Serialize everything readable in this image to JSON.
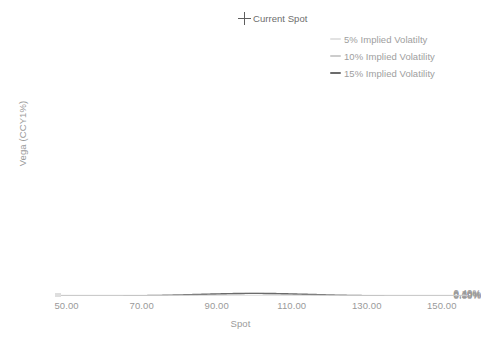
{
  "chart_data": {
    "type": "line",
    "title": "",
    "xlabel": "Spot",
    "ylabel": "Vega (CCY1%)",
    "xlim": [
      48.5,
      157.0
    ],
    "ylim": [
      0.0,
      0.4235
    ],
    "grid": false,
    "legend_position": "top-right",
    "x_ticks": [
      50,
      70,
      90,
      110,
      130,
      150
    ],
    "x_tick_labels": [
      "50.00",
      "70.00",
      "90.00",
      "110.00",
      "130.00",
      "150.00"
    ],
    "y_ticks": [
      0.0,
      0.001,
      0.002,
      0.003,
      0.004
    ],
    "y_tick_labels": [
      "0.00%",
      "0.10%",
      "0.20%",
      "0.30%",
      "0.40%"
    ],
    "annotations": [
      {
        "label": "Current Spot",
        "marker": "plus",
        "x": 100,
        "y": 0.00397,
        "color": "#5e5e5e"
      }
    ],
    "series": [
      {
        "name": "5% Implied Volatilty",
        "color": "#e9e9e9",
        "width": 1.2,
        "peak_x": 100,
        "peak_y": 0.00397,
        "sigma": 5.0,
        "x": [
          50,
          55,
          60,
          65,
          70,
          75,
          80,
          82,
          84,
          86,
          88,
          90,
          92,
          94,
          96,
          98,
          100,
          102,
          104,
          106,
          108,
          110,
          112,
          114,
          116,
          118,
          120,
          125,
          130,
          135,
          140,
          145,
          150,
          155
        ],
        "values": [
          0.0,
          0.0,
          0.0,
          0.0,
          0.0,
          0.0,
          1e-05,
          3e-05,
          8e-05,
          0.0002,
          0.00045,
          0.00092,
          0.00166,
          0.00258,
          0.00341,
          0.00391,
          0.00397,
          0.00369,
          0.00316,
          0.00244,
          0.00168,
          0.00103,
          0.00057,
          0.00028,
          0.00012,
          5e-05,
          2e-05,
          0.0,
          0.0,
          0.0,
          0.0,
          0.0,
          0.0,
          0.0
        ]
      },
      {
        "name": "10% Implied Volatility",
        "color": "#d4d4d4",
        "width": 1.2,
        "peak_x": 100,
        "peak_y": 0.00397,
        "sigma": 10.0,
        "x": [
          50,
          55,
          60,
          65,
          70,
          75,
          80,
          85,
          90,
          95,
          100,
          105,
          110,
          115,
          120,
          125,
          130,
          135,
          140,
          145,
          150,
          155
        ],
        "values": [
          0.0,
          0.0,
          1e-05,
          7e-05,
          0.00035,
          0.00108,
          0.00235,
          0.00357,
          0.00397,
          0.00372,
          0.00317,
          0.00244,
          0.00161,
          0.00092,
          0.00046,
          0.0002,
          8e-05,
          3e-05,
          1e-05,
          0.0,
          0.0,
          0.0
        ]
      },
      {
        "name": "15% Implied Volatility",
        "color": "#6b6b6b",
        "width": 1.4,
        "peak_x": 100,
        "peak_y": 0.00397,
        "sigma": 15.0,
        "x": [
          50,
          55,
          60,
          65,
          70,
          75,
          80,
          85,
          90,
          95,
          100,
          105,
          110,
          115,
          120,
          125,
          130,
          135,
          140,
          145,
          150,
          155
        ],
        "values": [
          3e-05,
          0.00014,
          0.00046,
          0.00118,
          0.00237,
          0.00356,
          0.00392,
          0.00386,
          0.00373,
          0.00381,
          0.00397,
          0.00379,
          0.00338,
          0.00276,
          0.00207,
          0.00143,
          0.00091,
          0.00053,
          0.00029,
          0.00014,
          7e-05,
          3e-05
        ]
      }
    ]
  },
  "axes": {
    "y_title": "Vega (CCY1%)",
    "x_title": "Spot"
  },
  "legend": {
    "items": [
      {
        "label": "5% Implied Volatilty",
        "color": "#e2e2e2"
      },
      {
        "label": "10% Implied Volatility",
        "color": "#cccccc"
      },
      {
        "label": "15% Implied Volatility",
        "color": "#6b6b6b"
      }
    ]
  },
  "annotation": {
    "current_spot_label": "Current Spot"
  },
  "colors": {
    "axis_line": "#dcdcdc",
    "tick_text": "#9a9a9a",
    "background": "#ffffff"
  }
}
